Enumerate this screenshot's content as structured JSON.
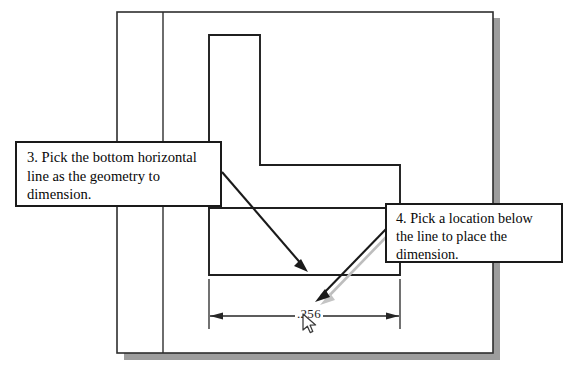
{
  "document": {
    "type": "cad-tutorial-screenshot",
    "title": "Dimensioning a bottom horizontal line"
  },
  "callouts": [
    {
      "id": "step-3",
      "number": "3",
      "lines": [
        "3. Pick the bottom horizontal",
        "line as the geometry to",
        "dimension."
      ],
      "arrow_points_to": "bottom horizontal line of part"
    },
    {
      "id": "step-4",
      "number": "4",
      "lines": [
        "4. Pick a location below",
        "the line to place the",
        "dimension."
      ],
      "arrow_points_to": "dimension line placement location"
    }
  ],
  "drawing": {
    "dimension": {
      "value": ".256",
      "label": "dimension-value"
    },
    "cursor": {
      "name": "mouse-pointer",
      "x": 302,
      "y": 313
    }
  },
  "colors": {
    "line": "#1a1a1a",
    "geometry": "#2b2b2b",
    "shadow": "#9a9a9a",
    "arrow_shadow": "#b5b5b5",
    "paper": "#ffffff"
  }
}
